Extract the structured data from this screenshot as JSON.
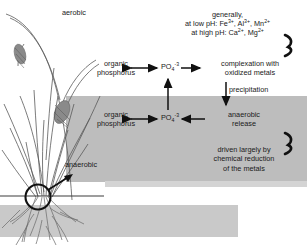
{
  "diagram": {
    "zones": {
      "aerobic_label": "aerobic",
      "anaerobic_label": "anaerobic",
      "anaerobic_fill": "#bdbdbd",
      "soil_fill": "#c9c9c9",
      "background": "#ffffff"
    },
    "notes": {
      "metals_line1": "generally,",
      "metals_line2_prefix": "at low pH: Fe",
      "metals_line2_mid": ", Al",
      "metals_line2_end": ", Mn",
      "metals_line3_prefix": "at high pH: Ca",
      "metals_line3_end": ", Mg",
      "charge_3plus": "3+",
      "charge_2plus": "2+"
    },
    "nodes": {
      "organic_phosphorus_aerobic_line1": "organic",
      "organic_phosphorus_aerobic_line2": "phosphorus",
      "organic_phosphorus_anaerobic_line1": "organic",
      "organic_phosphorus_anaerobic_line2": "phosphorus",
      "phosphate_formula_base": "PO",
      "phosphate_subscript": "4",
      "phosphate_superscript": "-3",
      "complexation_line1": "complexation with",
      "complexation_line2": "oxidized metals",
      "anaerobic_release_line1": "anaerobic",
      "anaerobic_release_line2": "release",
      "driven_line1": "driven largely by",
      "driven_line2": "chemical reduction",
      "driven_line3": "of the metals"
    },
    "edges": {
      "precipitation_label": "precipitation"
    },
    "illustration": {
      "name": "grass-plant-with-roots-and-callout-circle",
      "callout": "magnifier-circle-with-arrow"
    }
  }
}
